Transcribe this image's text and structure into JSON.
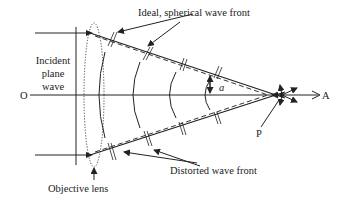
{
  "diagram": {
    "labels": {
      "ideal_wave_front": "Ideal, spherical wave front",
      "incident_line1": "Incident",
      "incident_line2": "plane",
      "incident_line3": "wave",
      "axis_origin": "O",
      "axis_end": "A",
      "angle": "a",
      "focal_point": "P",
      "distorted_wave_front": "Distorted wave front",
      "objective_lens": "Objective lens"
    },
    "colors": {
      "stroke": "#222222",
      "background": "#ffffff"
    }
  }
}
